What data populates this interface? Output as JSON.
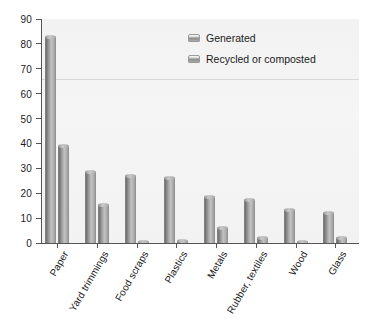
{
  "chart_data": {
    "type": "bar",
    "title": "",
    "subtitle": "",
    "xlabel": "",
    "ylabel": "",
    "ylim": [
      0,
      90
    ],
    "ytick_step": 10,
    "yticks": [
      "0",
      "10",
      "20",
      "30",
      "40",
      "50",
      "60",
      "70",
      "80",
      "90"
    ],
    "grid": false,
    "legend_position": "top-right",
    "categories": [
      "Paper",
      "Yard trimmings",
      "Food scraps",
      "Plastics",
      "Metals",
      "Rubber, textiles",
      "Wood",
      "Glass"
    ],
    "series": [
      {
        "name": "Generated",
        "values": [
          83,
          29,
          27.5,
          26.5,
          19,
          17.5,
          13.5,
          12.3
        ]
      },
      {
        "name": "Recycled or composted",
        "values": [
          39.5,
          15.5,
          0.7,
          1.3,
          6.5,
          2.5,
          0.8,
          2.5
        ]
      }
    ],
    "annotations": [
      {
        "name": "faint-horizontal-rule",
        "value": 66
      }
    ]
  },
  "legend": {
    "items": [
      {
        "label": "Generated",
        "swatch": "legend-swatch-generated"
      },
      {
        "label": "Recycled or composted",
        "swatch": "legend-swatch-recycled"
      }
    ]
  },
  "colors": {
    "bar_light": "#c2c2c2",
    "bar_dark": "#6f6f6f",
    "axis": "#555555",
    "plot_background": "#f3f3f3",
    "text": "#1a1a1a"
  }
}
